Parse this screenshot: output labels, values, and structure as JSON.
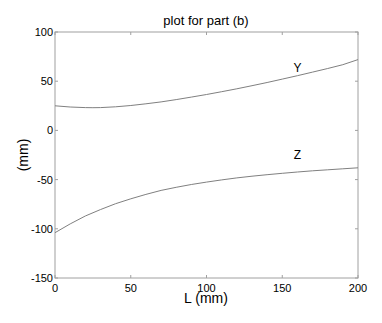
{
  "chart_data": {
    "type": "line",
    "title": "plot for part (b)",
    "xlabel": "L (mm)",
    "ylabel": "(mm)",
    "xlim": [
      0,
      200
    ],
    "ylim": [
      -150,
      100
    ],
    "xticks": [
      0,
      50,
      100,
      150,
      200
    ],
    "yticks": [
      -150,
      -100,
      -50,
      0,
      50,
      100
    ],
    "grid": false,
    "legend": "none",
    "series": [
      {
        "name": "Y",
        "label_position": {
          "x": 160,
          "y": 63
        },
        "x": [
          0,
          10,
          20,
          25,
          30,
          40,
          50,
          60,
          70,
          80,
          90,
          100,
          110,
          120,
          130,
          140,
          150,
          160,
          170,
          180,
          190,
          200
        ],
        "values": [
          25,
          23.8,
          23.2,
          23.1,
          23.2,
          24,
          25.3,
          27,
          29,
          31.3,
          33.8,
          36.5,
          39.3,
          42.3,
          45.4,
          48.7,
          52.1,
          55.6,
          59.2,
          62.9,
          66.8,
          72
        ]
      },
      {
        "name": "Z",
        "label_position": {
          "x": 160,
          "y": -25
        },
        "x": [
          0,
          10,
          20,
          30,
          40,
          50,
          60,
          70,
          80,
          90,
          100,
          110,
          120,
          130,
          140,
          150,
          160,
          170,
          180,
          190,
          200
        ],
        "values": [
          -104,
          -95,
          -87,
          -80.5,
          -74.5,
          -69.5,
          -65,
          -61,
          -57.8,
          -55,
          -52.5,
          -50.3,
          -48.3,
          -46.5,
          -45,
          -43.6,
          -42.3,
          -41.1,
          -40,
          -39,
          -38
        ]
      }
    ]
  },
  "colors": {
    "line": "#808080",
    "axes": "#a0a0a0",
    "text": "#000000"
  }
}
